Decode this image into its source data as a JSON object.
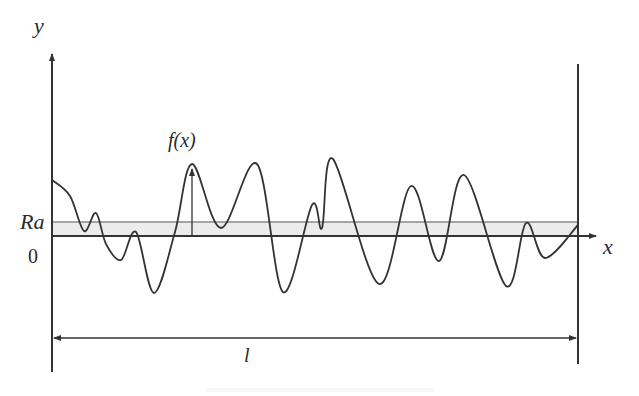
{
  "diagram": {
    "type": "surface-roughness-profile",
    "labels": {
      "y_axis": "y",
      "x_axis": "x",
      "function": "f(x)",
      "ra": "Ra",
      "zero": "0",
      "length": "l"
    },
    "colors": {
      "stroke": "#333333",
      "band_fill": "#ececec",
      "band_line": "#8a8a8a",
      "background": "#ffffff"
    },
    "profile_points": [
      [
        52,
        180
      ],
      [
        70,
        196
      ],
      [
        84,
        231
      ],
      [
        96,
        213
      ],
      [
        106,
        244
      ],
      [
        121,
        260
      ],
      [
        136,
        232
      ],
      [
        154,
        293
      ],
      [
        175,
        232
      ],
      [
        192,
        164
      ],
      [
        221,
        228
      ],
      [
        257,
        164
      ],
      [
        283,
        292
      ],
      [
        312,
        205
      ],
      [
        322,
        228
      ],
      [
        333,
        159
      ],
      [
        379,
        284
      ],
      [
        411,
        186
      ],
      [
        439,
        261
      ],
      [
        464,
        175
      ],
      [
        506,
        286
      ],
      [
        526,
        223
      ],
      [
        545,
        258
      ],
      [
        578,
        225
      ]
    ],
    "caption": ""
  }
}
